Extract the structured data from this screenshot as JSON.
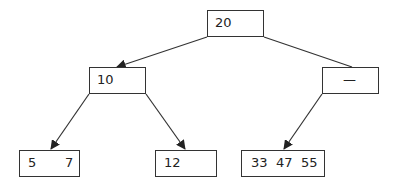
{
  "diagram": {
    "type": "tree",
    "stroke_color": "#333333",
    "background": "#ffffff",
    "nodes": {
      "root": {
        "keys": [
          "20"
        ]
      },
      "left": {
        "keys": [
          "10"
        ]
      },
      "right": {
        "keys": [
          "—"
        ]
      },
      "leaf_ll": {
        "keys": [
          "5",
          "7"
        ]
      },
      "leaf_lr": {
        "keys": [
          "12"
        ]
      },
      "leaf_rl": {
        "keys": [
          "33",
          "47",
          "55"
        ]
      }
    },
    "edges": [
      {
        "from": "root",
        "to": "left",
        "arrow": true
      },
      {
        "from": "root",
        "to": "right",
        "arrow": false
      },
      {
        "from": "left",
        "to": "leaf_ll",
        "arrow": true
      },
      {
        "from": "left",
        "to": "leaf_lr",
        "arrow": true
      },
      {
        "from": "right",
        "to": "leaf_rl",
        "arrow": true
      }
    ]
  }
}
